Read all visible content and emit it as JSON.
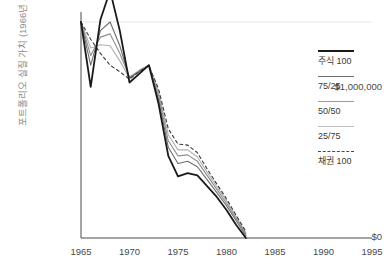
{
  "chart_data": {
    "type": "line",
    "title": "",
    "subtitle": "",
    "xlabel": "",
    "ylabel": "포트폴리오 실질 가치 (1966년 기준)",
    "xlim": [
      1965,
      1995
    ],
    "ylim": [
      0,
      1000000
    ],
    "xticks": [
      1965,
      1970,
      1975,
      1980,
      1985,
      1990,
      1995
    ],
    "xtick_labels": [
      "1965",
      "1970",
      "1975",
      "1980",
      "1985",
      "1990",
      "1995"
    ],
    "yticks": [
      0,
      1000000
    ],
    "ytick_labels": [
      "$0",
      "$1,000,000"
    ],
    "grid": true,
    "gridlines_y": [
      1000000
    ],
    "legend_position": "right",
    "x": [
      1965,
      1966,
      1967,
      1968,
      1969,
      1970,
      1971,
      1972,
      1973,
      1974,
      1975,
      1976,
      1977,
      1978,
      1979,
      1980,
      1981,
      1982
    ],
    "series": [
      {
        "name": "주식 100",
        "color": "#1a1a1a",
        "width": 1.8,
        "dash": "none",
        "values": [
          1000000,
          700000,
          1010000,
          1145000,
          960000,
          720000,
          760000,
          800000,
          620000,
          380000,
          285000,
          300000,
          290000,
          240000,
          190000,
          130000,
          60000,
          0
        ]
      },
      {
        "name": "75/25",
        "color": "#6e6e6e",
        "width": 1.1,
        "dash": "none",
        "values": [
          1000000,
          800000,
          960000,
          1000000,
          890000,
          740000,
          770000,
          800000,
          640000,
          420000,
          345000,
          355000,
          330000,
          270000,
          210000,
          150000,
          80000,
          10000
        ]
      },
      {
        "name": "50/50",
        "color": "#8f8f8f",
        "width": 1.1,
        "dash": "none",
        "values": [
          1000000,
          845000,
          930000,
          945000,
          855000,
          745000,
          775000,
          800000,
          660000,
          450000,
          380000,
          385000,
          355000,
          290000,
          225000,
          162000,
          90000,
          18000
        ]
      },
      {
        "name": "25/75",
        "color": "#b0b0b0",
        "width": 1.1,
        "dash": "none",
        "values": [
          1000000,
          880000,
          895000,
          890000,
          820000,
          740000,
          775000,
          800000,
          675000,
          478000,
          408000,
          408000,
          375000,
          305000,
          238000,
          172000,
          98000,
          24000
        ]
      },
      {
        "name": "채권 100",
        "color": "#3a3a3a",
        "width": 1.1,
        "dash": "3,3",
        "values": [
          1000000,
          920000,
          855000,
          800000,
          770000,
          735000,
          770000,
          798000,
          690000,
          505000,
          435000,
          430000,
          395000,
          320000,
          250000,
          182000,
          105000,
          30000
        ]
      }
    ]
  },
  "axis": {
    "ytick_top": "$1,000,000",
    "ytick_zero": "$0",
    "ylabel": "포트폴리오 실질 가치 (1966년 기준)",
    "xticks": [
      "1965",
      "1970",
      "1975",
      "1980",
      "1985",
      "1990",
      "1995"
    ]
  },
  "legend": {
    "items": [
      {
        "label": "주식 100",
        "color": "#1a1a1a",
        "thickness": "2.2px",
        "dashed": false
      },
      {
        "label": "75/25",
        "color": "#6e6e6e",
        "thickness": "1.4px",
        "dashed": false
      },
      {
        "label": "50/50",
        "color": "#9a9a9a",
        "thickness": "1.4px",
        "dashed": false
      },
      {
        "label": "25/75",
        "color": "#bdbdbd",
        "thickness": "1.4px",
        "dashed": false
      },
      {
        "label": "채권 100",
        "color": "#4a4a4a",
        "thickness": "1.2px",
        "dashed": true
      }
    ]
  },
  "colors": {
    "axis": "#4a4a4a",
    "grid": "#e8e8e8",
    "ylabel_text": "#8a8a8a",
    "tick_text": "#4a4a4a",
    "background": "#ffffff"
  }
}
